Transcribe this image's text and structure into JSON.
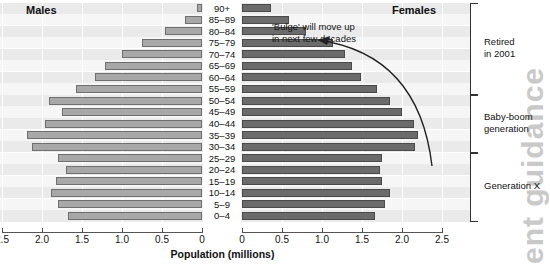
{
  "chart_data": {
    "type": "bar",
    "subtype": "population-pyramid",
    "title": "",
    "xlabel": "Population (millions)",
    "ylabel": "",
    "categories": [
      "90+",
      "85–89",
      "80–84",
      "75–79",
      "70–74",
      "65–69",
      "60–64",
      "55–59",
      "50–54",
      "45–49",
      "40–44",
      "35–39",
      "30–34",
      "25–29",
      "20–24",
      "15–19",
      "10–14",
      "5–9",
      "0–4"
    ],
    "series": [
      {
        "name": "Males",
        "side": "left",
        "color": "#a8a8a8",
        "values": [
          0.06,
          0.21,
          0.46,
          0.75,
          1.0,
          1.21,
          1.34,
          1.57,
          1.91,
          1.75,
          1.96,
          2.19,
          2.12,
          1.8,
          1.7,
          1.82,
          1.89,
          1.8,
          1.68
        ]
      },
      {
        "name": "Females",
        "side": "right",
        "color": "#6b6b6b",
        "values": [
          0.36,
          0.59,
          0.8,
          1.14,
          1.29,
          1.37,
          1.49,
          1.69,
          1.85,
          2.0,
          2.15,
          2.2,
          2.16,
          1.75,
          1.72,
          1.75,
          1.85,
          1.79,
          1.66
        ]
      }
    ],
    "xticks_left": [
      "2.5",
      "2.0",
      "1.5",
      "1.0",
      "0.5",
      "0"
    ],
    "xticks_right": [
      "0",
      "0.5",
      "1.0",
      "1.5",
      "2.0",
      "2.5"
    ],
    "xlim": [
      0,
      2.5
    ],
    "grid": true,
    "legend": "none",
    "annotations": [
      {
        "name": "bulge-note",
        "line1": "'Bulge' will move up",
        "line2": "in next few decades"
      }
    ],
    "brackets": [
      {
        "name": "retired",
        "line1": "Retired",
        "line2": "in 2001",
        "from": "90+",
        "to": "55–59"
      },
      {
        "name": "baby-boom",
        "line1": "Baby-boom",
        "line2": "generation",
        "from": "50–54",
        "to": "30–34"
      },
      {
        "name": "generation-x",
        "line1": "Generation X",
        "line2": "",
        "from": "25–29",
        "to": "0–4"
      }
    ]
  },
  "labels": {
    "males": "Males",
    "females": "Females",
    "axis_title": "Population (millions)"
  },
  "watermark": {
    "text": "ent guidance"
  }
}
